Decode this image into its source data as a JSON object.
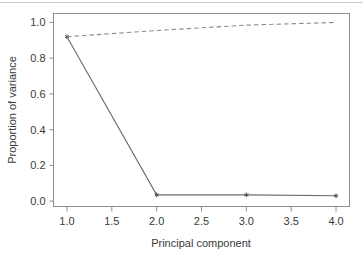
{
  "figure": {
    "type": "scree-plot",
    "background": "#ffffff",
    "top_rule_color": "#c9c9c9"
  },
  "chart_data": {
    "type": "line",
    "title": "",
    "subtitle": "",
    "xlabel": "Principal component",
    "ylabel": "Proportion of variance",
    "x": [
      1.0,
      2.0,
      3.0,
      4.0
    ],
    "xlim": [
      0.85,
      4.15
    ],
    "ylim": [
      -0.03,
      1.05
    ],
    "xticks": [
      1.0,
      1.5,
      2.0,
      2.5,
      3.0,
      3.5,
      4.0
    ],
    "xtick_labels": [
      "1.0",
      "1.5",
      "2.0",
      "2.5",
      "3.0",
      "3.5",
      "4.0"
    ],
    "yticks": [
      0.0,
      0.2,
      0.4,
      0.6,
      0.8,
      1.0
    ],
    "ytick_labels": [
      "0.0",
      "0.2",
      "0.4",
      "0.6",
      "0.8",
      "1.0"
    ],
    "grid": false,
    "legend": "none",
    "series": [
      {
        "name": "Proportion of variance",
        "style": "solid",
        "color": "#6a6a6a",
        "marker": "asterisk",
        "values": [
          0.92,
          0.035,
          0.035,
          0.03
        ]
      },
      {
        "name": "Cumulative proportion of variance",
        "style": "dashed",
        "color": "#8c8c8c",
        "marker": "none",
        "values": [
          0.92,
          0.955,
          0.985,
          1.0
        ]
      }
    ]
  }
}
